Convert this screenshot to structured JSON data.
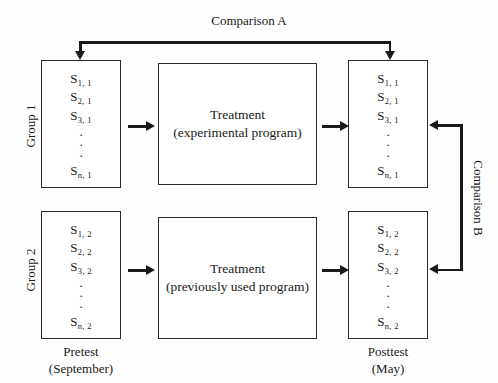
{
  "diagram": {
    "line_color": "#1a1a1a",
    "background": "#fefefe"
  },
  "comparisons": {
    "a": "Comparison A",
    "b": "Comparison B"
  },
  "groups": [
    {
      "id": "group-1",
      "label": "Group 1"
    },
    {
      "id": "group-2",
      "label": "Group 2"
    }
  ],
  "stages": {
    "pretest": {
      "name": "Pretest",
      "time": "(September)"
    },
    "posttest": {
      "name": "Posttest",
      "time": "(May)"
    }
  },
  "treatments": [
    {
      "name": "Treatment",
      "detail": "(experimental program)"
    },
    {
      "name": "Treatment",
      "detail": "(previously used program)"
    }
  ],
  "subject_lists": {
    "group1_pretest": [
      {
        "base": "S",
        "sub": "1, 1"
      },
      {
        "base": "S",
        "sub": "2, 1"
      },
      {
        "base": "S",
        "sub": "3, 1"
      },
      {
        "base": "S",
        "sub": "n, 1"
      }
    ],
    "group1_posttest": [
      {
        "base": "S",
        "sub": "1, 1"
      },
      {
        "base": "S",
        "sub": "2, 1"
      },
      {
        "base": "S",
        "sub": "3, 1"
      },
      {
        "base": "S",
        "sub": "n, 1"
      }
    ],
    "group2_pretest": [
      {
        "base": "S",
        "sub": "1, 2"
      },
      {
        "base": "S",
        "sub": "2, 2"
      },
      {
        "base": "S",
        "sub": "3, 2"
      },
      {
        "base": "S",
        "sub": "n, 2"
      }
    ],
    "group2_posttest": [
      {
        "base": "S",
        "sub": "1, 2"
      },
      {
        "base": "S",
        "sub": "2, 2"
      },
      {
        "base": "S",
        "sub": "3, 2"
      },
      {
        "base": "S",
        "sub": "n, 2"
      }
    ]
  },
  "ellipsis": "⋮"
}
